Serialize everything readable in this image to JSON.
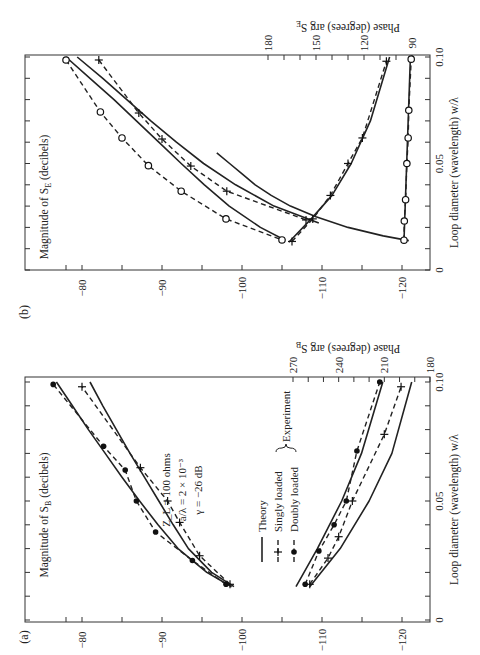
{
  "figure": {
    "panels": [
      "(a)",
      "(b)"
    ]
  },
  "chart_data": [
    {
      "type": "line",
      "panel": "(a)",
      "xlabel": "Loop diameter (wavelength) w/λ",
      "ylabel_left": "Magnitude of S_B (decibels)",
      "ylabel_right": "Phase (degrees) arg S_B",
      "x_ticks": [
        "0",
        "0.05",
        "0.10"
      ],
      "xlim": [
        0,
        0.1
      ],
      "mag_ticks": [
        "-80",
        "-90",
        "-100",
        "-110",
        "-120"
      ],
      "mag_lim": [
        -76,
        -122
      ],
      "phase_ticks": [
        "270",
        "240",
        "210",
        "180"
      ],
      "phase_lim": [
        270,
        180
      ],
      "annotation": [
        "Z_L = 100 ohms",
        "a/λ = 2 × 10⁻³",
        "γ = −26 dB"
      ],
      "legend": [
        "Theory",
        "Singly loaded",
        "Doubly loaded",
        "Experiment"
      ],
      "series": [
        {
          "name": "Magnitude – Doubly loaded (experiment)",
          "axis": "mag",
          "marker": "dot",
          "x": [
            0.015,
            0.025,
            0.037,
            0.05,
            0.063,
            0.073,
            0.099
          ],
          "values": [
            -98,
            -93.8,
            -89.2,
            -86.8,
            -85.4,
            -82.7,
            -76.4
          ]
        },
        {
          "name": "Magnitude – Singly loaded (experiment)",
          "axis": "mag",
          "marker": "plus",
          "x": [
            0.015,
            0.027,
            0.041,
            0.05,
            0.064,
            0.098
          ],
          "values": [
            -98.5,
            -94.7,
            -92.2,
            -90.7,
            -87.3,
            -80
          ]
        },
        {
          "name": "Magnitude – Doubly loaded (theory)",
          "axis": "mag",
          "marker": "none",
          "x": [
            0.014,
            0.02,
            0.03,
            0.04,
            0.05,
            0.06,
            0.07,
            0.08,
            0.09,
            0.1
          ],
          "values": [
            -98.7,
            -95.6,
            -92,
            -89.5,
            -87.2,
            -85,
            -82.9,
            -80.8,
            -78.8,
            -76.8
          ]
        },
        {
          "name": "Magnitude – Singly loaded (theory)",
          "axis": "mag",
          "marker": "none",
          "x": [
            0.014,
            0.02,
            0.03,
            0.04,
            0.05,
            0.06,
            0.07,
            0.08,
            0.09,
            0.1
          ],
          "values": [
            -99,
            -96.2,
            -93.3,
            -91.4,
            -89.6,
            -87.8,
            -86,
            -84.3,
            -82.6,
            -81
          ]
        },
        {
          "name": "Phase – Doubly loaded (experiment)",
          "axis": "phase",
          "marker": "dot",
          "x": [
            0.015,
            0.029,
            0.04,
            0.05,
            0.071,
            0.1
          ],
          "values": [
            262,
            253,
            243,
            235,
            228,
            213
          ]
        },
        {
          "name": "Phase – Singly loaded (experiment)",
          "axis": "phase",
          "marker": "plus",
          "x": [
            0.015,
            0.026,
            0.035,
            0.05,
            0.078,
            0.098
          ],
          "values": [
            259,
            247,
            240,
            231,
            210,
            199
          ]
        },
        {
          "name": "Phase – Doubly loaded (theory)",
          "axis": "phase",
          "marker": "none",
          "x": [
            0.014,
            0.03,
            0.05,
            0.07,
            0.1
          ],
          "values": [
            268,
            254,
            238,
            225,
            211
          ]
        },
        {
          "name": "Phase – Singly loaded (theory)",
          "axis": "phase",
          "marker": "none",
          "x": [
            0.014,
            0.03,
            0.05,
            0.07,
            0.1
          ],
          "values": [
            259,
            239,
            220,
            205,
            192
          ]
        }
      ]
    },
    {
      "type": "line",
      "panel": "(b)",
      "xlabel": "Loop diameter (wavelength) w/λ",
      "ylabel_left": "Magnitude of S_E (decibels)",
      "ylabel_right": "Phase (degrees) arg S_E",
      "x_ticks": [
        "0",
        "0.05",
        "0.10"
      ],
      "xlim": [
        0,
        0.1
      ],
      "mag_ticks": [
        "-80",
        "-90",
        "-100",
        "-110",
        "-120"
      ],
      "mag_lim": [
        -76,
        -122
      ],
      "phase_ticks": [
        "180",
        "150",
        "120",
        "90"
      ],
      "phase_lim": [
        180,
        90
      ],
      "series": [
        {
          "name": "Magnitude – Doubly loaded (experiment)",
          "axis": "mag",
          "marker": "circle",
          "x": [
            0.0986,
            0.0742,
            0.062,
            0.049,
            0.037,
            0.024,
            0.0141
          ],
          "values": [
            -78,
            -82.3,
            -85,
            -88.3,
            -92.4,
            -98,
            -105
          ]
        },
        {
          "name": "Magnitude – Singly loaded (experiment)",
          "axis": "mag",
          "marker": "plus",
          "x": [
            0.0986,
            0.0737,
            0.0615,
            0.0488,
            0.037,
            0.0235
          ],
          "values": [
            -82.1,
            -87.1,
            -90,
            -93.6,
            -98.1,
            -108
          ]
        },
        {
          "name": "Magnitude – Doubly loaded (theory)",
          "axis": "mag",
          "marker": "none",
          "x": [
            0.014,
            0.02,
            0.03,
            0.04,
            0.05,
            0.06,
            0.07,
            0.08,
            0.09,
            0.1
          ],
          "values": [
            -105.4,
            -102.3,
            -98.4,
            -95.3,
            -92.4,
            -89.6,
            -86.8,
            -84,
            -81,
            -78
          ]
        },
        {
          "name": "Magnitude – Singly loaded (theory)",
          "axis": "mag",
          "marker": "none",
          "x": [
            0.022,
            0.03,
            0.04,
            0.05,
            0.06,
            0.07,
            0.08,
            0.09,
            0.1
          ],
          "values": [
            -109.6,
            -104,
            -99.2,
            -95.2,
            -91.8,
            -88.6,
            -85.6,
            -82.6,
            -79.4
          ]
        },
        {
          "name": "Phase – Singly loaded (experiment)",
          "axis": "phase",
          "marker": "plus",
          "x": [
            0.0134,
            0.024,
            0.035,
            0.05,
            0.062,
            0.098
          ],
          "values": [
            165,
            152,
            141,
            130,
            121,
            106
          ]
        },
        {
          "name": "Phase – Doubly loaded (experiment)",
          "axis": "phase",
          "marker": "circle",
          "x": [
            0.014,
            0.023,
            0.033,
            0.05,
            0.062,
            0.075,
            0.099
          ],
          "values": [
            95,
            94.8,
            94,
            93.2,
            92.4,
            92,
            90.5
          ]
        },
        {
          "name": "Phase – Singly loaded (theory)",
          "axis": "phase",
          "marker": "none",
          "x": [
            0.013,
            0.024,
            0.035,
            0.05,
            0.07,
            0.1
          ],
          "values": [
            167,
            153,
            140,
            128,
            116,
            104
          ]
        },
        {
          "name": "Phase – Doubly loaded (theory, steep)",
          "axis": "phase",
          "marker": "none",
          "x": [
            0.0138,
            0.016,
            0.02,
            0.025,
            0.03,
            0.035,
            0.04,
            0.045,
            0.05,
            0.055
          ],
          "values": [
            92,
            108,
            130,
            150,
            166,
            178,
            188,
            196,
            204,
            212
          ]
        },
        {
          "name": "Phase – Doubly loaded (theory, flat)",
          "axis": "phase",
          "marker": "none",
          "x": [
            0.014,
            0.1
          ],
          "values": [
            95,
            91
          ]
        }
      ]
    }
  ]
}
